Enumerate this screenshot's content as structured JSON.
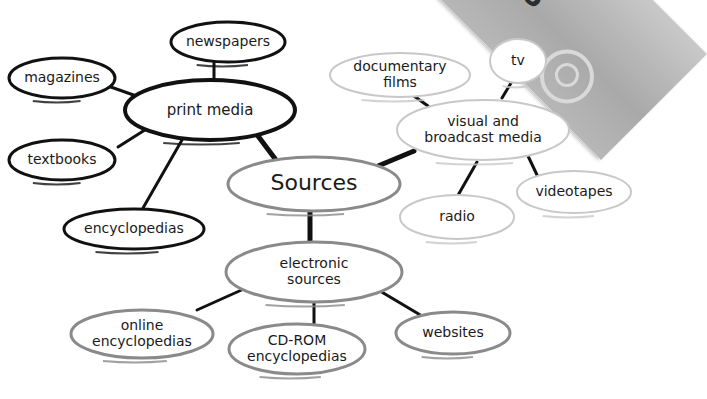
{
  "diagram": {
    "type": "concept-map",
    "title": "Sources",
    "corner_graphic": {
      "text": "STE",
      "rotation_deg": 225
    },
    "colors": {
      "dark_stroke": "#111111",
      "mid_stroke": "#8a8a8a",
      "light_stroke": "#c8c8c8",
      "text": "#1a1a1a",
      "background": "#ffffff"
    },
    "nodes": [
      {
        "id": "sources",
        "lines": [
          "Sources"
        ],
        "cx": 314,
        "cy": 184,
        "rx": 86,
        "ry": 27,
        "style": "mid",
        "font": 22
      },
      {
        "id": "print-media",
        "lines": [
          "print media"
        ],
        "cx": 210,
        "cy": 110,
        "rx": 85,
        "ry": 30,
        "style": "dark",
        "font": 15
      },
      {
        "id": "newspapers",
        "lines": [
          "newspapers"
        ],
        "cx": 228,
        "cy": 42,
        "rx": 57,
        "ry": 20,
        "style": "dark",
        "font": 14
      },
      {
        "id": "magazines",
        "lines": [
          "magazines"
        ],
        "cx": 62,
        "cy": 78,
        "rx": 53,
        "ry": 20,
        "style": "dark",
        "font": 14
      },
      {
        "id": "textbooks",
        "lines": [
          "textbooks"
        ],
        "cx": 62,
        "cy": 160,
        "rx": 53,
        "ry": 20,
        "style": "dark",
        "font": 14
      },
      {
        "id": "encyclopedias",
        "lines": [
          "encyclopedias"
        ],
        "cx": 134,
        "cy": 229,
        "rx": 70,
        "ry": 20,
        "style": "dark",
        "font": 14
      },
      {
        "id": "visual-broadcast-media",
        "lines": [
          "visual and",
          "broadcast media"
        ],
        "cx": 483,
        "cy": 130,
        "rx": 86,
        "ry": 30,
        "style": "light",
        "font": 14
      },
      {
        "id": "documentary-films",
        "lines": [
          "documentary",
          "films"
        ],
        "cx": 400,
        "cy": 75,
        "rx": 70,
        "ry": 22,
        "style": "light",
        "font": 14
      },
      {
        "id": "tv",
        "lines": [
          "tv"
        ],
        "cx": 518,
        "cy": 61,
        "rx": 28,
        "ry": 22,
        "style": "light",
        "font": 14
      },
      {
        "id": "radio",
        "lines": [
          "radio"
        ],
        "cx": 457,
        "cy": 217,
        "rx": 57,
        "ry": 22,
        "style": "light",
        "font": 14
      },
      {
        "id": "videotapes",
        "lines": [
          "videotapes"
        ],
        "cx": 574,
        "cy": 192,
        "rx": 57,
        "ry": 21,
        "style": "light",
        "font": 14
      },
      {
        "id": "electronic-sources",
        "lines": [
          "electronic",
          "sources"
        ],
        "cx": 314,
        "cy": 272,
        "rx": 88,
        "ry": 30,
        "style": "mid",
        "font": 14
      },
      {
        "id": "online-encyclopedias",
        "lines": [
          "online",
          "encyclopedias"
        ],
        "cx": 142,
        "cy": 334,
        "rx": 71,
        "ry": 24,
        "style": "mid",
        "font": 14
      },
      {
        "id": "cd-rom-encyclopedias",
        "lines": [
          "CD-ROM",
          "encyclopedias"
        ],
        "cx": 297,
        "cy": 349,
        "rx": 68,
        "ry": 25,
        "style": "mid",
        "font": 14
      },
      {
        "id": "websites",
        "lines": [
          "websites"
        ],
        "cx": 453,
        "cy": 333,
        "rx": 57,
        "ry": 21,
        "style": "mid",
        "font": 14
      }
    ],
    "edges": [
      {
        "from": "sources",
        "to": "print-media",
        "x1": 276,
        "y1": 160,
        "x2": 258,
        "y2": 136,
        "width": 5
      },
      {
        "from": "sources",
        "to": "visual-broadcast-media",
        "x1": 378,
        "y1": 166,
        "x2": 414,
        "y2": 151,
        "width": 5
      },
      {
        "from": "sources",
        "to": "electronic-sources",
        "x1": 310,
        "y1": 212,
        "x2": 310,
        "y2": 242,
        "width": 5
      },
      {
        "from": "print-media",
        "to": "newspapers",
        "x1": 214,
        "y1": 80,
        "x2": 214,
        "y2": 62,
        "width": 3
      },
      {
        "from": "print-media",
        "to": "magazines",
        "x1": 142,
        "y1": 98,
        "x2": 108,
        "y2": 86,
        "width": 3
      },
      {
        "from": "print-media",
        "to": "textbooks",
        "x1": 148,
        "y1": 128,
        "x2": 118,
        "y2": 147,
        "width": 3
      },
      {
        "from": "print-media",
        "to": "encyclopedias",
        "x1": 182,
        "y1": 140,
        "x2": 143,
        "y2": 208,
        "width": 3
      },
      {
        "from": "visual-broadcast-media",
        "to": "documentary-films",
        "x1": 428,
        "y1": 106,
        "x2": 414,
        "y2": 96,
        "width": 3
      },
      {
        "from": "visual-broadcast-media",
        "to": "tv",
        "x1": 502,
        "y1": 98,
        "x2": 511,
        "y2": 83,
        "width": 3
      },
      {
        "from": "visual-broadcast-media",
        "to": "radio",
        "x1": 477,
        "y1": 162,
        "x2": 457,
        "y2": 197,
        "width": 3
      },
      {
        "from": "visual-broadcast-media",
        "to": "videotapes",
        "x1": 528,
        "y1": 156,
        "x2": 538,
        "y2": 177,
        "width": 3
      },
      {
        "from": "electronic-sources",
        "to": "online-encyclopedias",
        "x1": 246,
        "y1": 288,
        "x2": 197,
        "y2": 310,
        "width": 3
      },
      {
        "from": "electronic-sources",
        "to": "cd-rom-encyclopedias",
        "x1": 314,
        "y1": 302,
        "x2": 314,
        "y2": 324,
        "width": 3
      },
      {
        "from": "electronic-sources",
        "to": "websites",
        "x1": 380,
        "y1": 291,
        "x2": 422,
        "y2": 316,
        "width": 3
      }
    ]
  }
}
